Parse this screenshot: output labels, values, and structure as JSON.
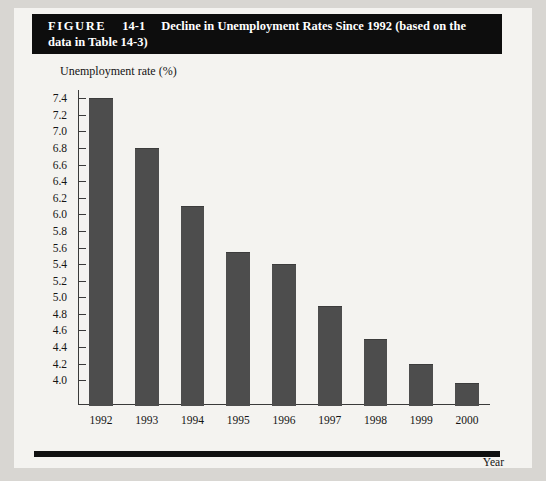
{
  "figure": {
    "label": "FIGURE",
    "number": "14-1",
    "caption_line1": "Decline in Unemployment Rates Since 1992 (based on the",
    "caption_line2": "data in Table 14-3)",
    "banner_bg": "#0d0d0d",
    "banner_text_color": "#ffffff"
  },
  "chart_data": {
    "type": "bar",
    "title": "Decline in Unemployment Rates Since 1992 (based on the data in Table 14-3)",
    "categories": [
      "1992",
      "1993",
      "1994",
      "1995",
      "1996",
      "1997",
      "1998",
      "1999",
      "2000"
    ],
    "values": [
      7.4,
      6.8,
      6.1,
      5.55,
      5.4,
      4.9,
      4.5,
      4.2,
      3.97
    ],
    "xlabel": "Year",
    "ylabel": "Unemployment rate (%)",
    "ylim": [
      3.7,
      7.5
    ],
    "ytick_values": [
      7.4,
      7.2,
      7.0,
      6.8,
      6.6,
      6.4,
      6.2,
      6.0,
      5.8,
      5.6,
      5.4,
      5.2,
      5.0,
      4.8,
      4.6,
      4.4,
      4.2,
      4.0
    ],
    "ytick_labels": [
      "7.4",
      "7.2",
      "7.0",
      "6.8",
      "6.6",
      "6.4",
      "6.2",
      "6.0",
      "5.8",
      "5.6",
      "5.4",
      "5.2",
      "5.0",
      "4.8",
      "4.6",
      "4.4",
      "4.2",
      "4.0"
    ],
    "grid": false,
    "legend": false,
    "bar_color": "#4d4d4d",
    "axis_color": "#3a3a3a"
  }
}
